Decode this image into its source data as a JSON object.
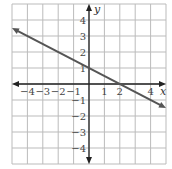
{
  "chart_data": {
    "type": "line",
    "title": "",
    "xlabel": "x",
    "ylabel": "y",
    "xlim": [
      -5,
      5
    ],
    "ylim": [
      -5,
      5
    ],
    "grid": true,
    "x_ticks": [
      -4,
      -3,
      -2,
      -1,
      1,
      2,
      4
    ],
    "y_ticks": [
      4,
      3,
      2,
      1,
      -1,
      -2,
      -3,
      -4
    ],
    "x_tick_labels": [
      "−4",
      "−3",
      "−2",
      "−1",
      "1",
      "2",
      "4"
    ],
    "y_tick_labels": [
      "4",
      "3",
      "2",
      "1",
      "−1",
      "−2",
      "−3",
      "−4"
    ],
    "series": [
      {
        "name": "line",
        "equation": "y = -x/2 + 1",
        "slope": -0.5,
        "intercept": 1,
        "x": [
          -5,
          5
        ],
        "y": [
          3.5,
          -1.5
        ],
        "arrows": "both",
        "color": "#555555"
      }
    ],
    "colors": {
      "grid": "#bbbbbb",
      "axes": "#222222",
      "line": "#555555"
    }
  }
}
